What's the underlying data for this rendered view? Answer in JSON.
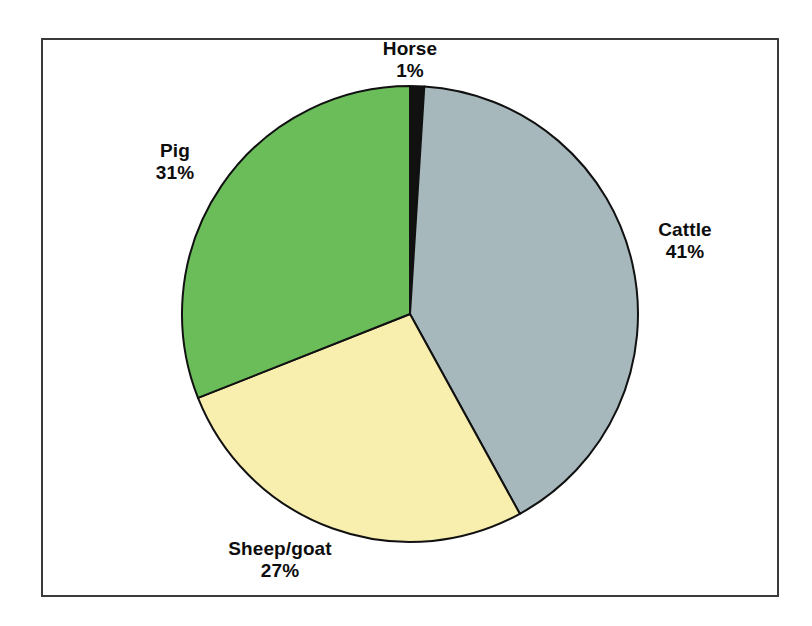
{
  "chart_data": {
    "type": "pie",
    "title": "",
    "subtitle": "",
    "xlabel": "",
    "ylabel": "",
    "grid": false,
    "legend_position": "none",
    "label_format": "name + percent, outside slice",
    "start_angle_deg": 0,
    "direction": "clockwise",
    "categories": [
      "Horse",
      "Cattle",
      "Sheep/goat",
      "Pig"
    ],
    "values": [
      1,
      41,
      27,
      31
    ],
    "unit": "%",
    "slices": [
      {
        "name": "Horse",
        "percent": 1,
        "percent_text": "1%",
        "color": "#111111",
        "start_deg": 0,
        "end_deg": 3.6
      },
      {
        "name": "Cattle",
        "percent": 41,
        "percent_text": "41%",
        "color": "#a7b8bc",
        "start_deg": 3.6,
        "end_deg": 151.2
      },
      {
        "name": "Sheep/goat",
        "percent": 27,
        "percent_text": "27%",
        "color": "#f8eeae",
        "start_deg": 151.2,
        "end_deg": 248.4
      },
      {
        "name": "Pig",
        "percent": 31,
        "percent_text": "31%",
        "color": "#6bbd5a",
        "start_deg": 248.4,
        "end_deg": 360
      }
    ],
    "geometry": {
      "center_x": 410,
      "center_y": 314,
      "radius": 228
    },
    "style": {
      "slice_outline_color": "#111111",
      "slice_outline_width": 2,
      "frame_border_color": "#3a3a3a",
      "background": "#ffffff",
      "label_color": "#0d0d0d"
    }
  }
}
